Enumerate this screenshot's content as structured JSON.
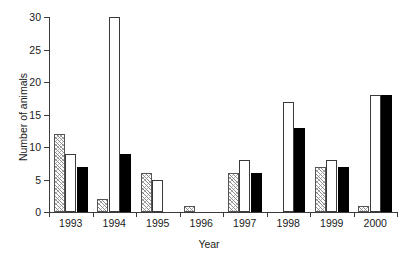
{
  "chart_data": {
    "type": "bar",
    "title": "",
    "xlabel": "Year",
    "ylabel": "Number of animals",
    "categories": [
      "1993",
      "1994",
      "1995",
      "1996",
      "1997",
      "1998",
      "1999",
      "2000"
    ],
    "ylim": [
      0,
      30
    ],
    "yticks": [
      0,
      5,
      10,
      15,
      20,
      25,
      30
    ],
    "grid": false,
    "legend": "none",
    "series": [
      {
        "name": "hatched",
        "fill": "hatched",
        "color": "#8c8c8c",
        "values": [
          12,
          2,
          6,
          1,
          6,
          0,
          7,
          1
        ]
      },
      {
        "name": "white",
        "fill": "open",
        "color": "#ffffff",
        "values": [
          9,
          30,
          5,
          0,
          8,
          17,
          8,
          18
        ]
      },
      {
        "name": "black",
        "fill": "solid",
        "color": "#000000",
        "values": [
          7,
          9,
          0,
          0,
          6,
          13,
          7,
          18
        ]
      }
    ]
  }
}
